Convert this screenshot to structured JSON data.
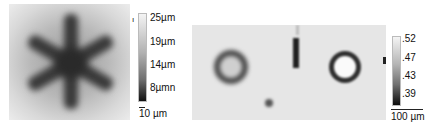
{
  "left_panel": {
    "description": "grayscale height map of six-armed star-shaped structure",
    "colorbar": {
      "ticks": [
        "25µm",
        "19µm",
        "14µm",
        "8µmn"
      ],
      "top_marker": "ı"
    },
    "scale_bar_label": "10 µm"
  },
  "right_panel": {
    "description": "grayscale map with two ring features, a vertical dark streak and a small dark spot",
    "colorbar": {
      "ticks": [
        ".52",
        ".47",
        ".43",
        ".39"
      ]
    },
    "scale_bar_label": "100 µm"
  },
  "colors": {
    "background": "#ffffff",
    "dark": "#1a1a1a",
    "light": "#f2f2f2"
  }
}
